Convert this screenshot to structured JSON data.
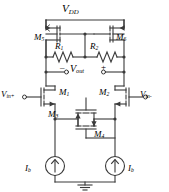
{
  "figure": {
    "kind": "circuit-schematic",
    "stroke_color": "#3a3a3a",
    "text_color": "#000000",
    "background_color": "#ffffff"
  },
  "labels": {
    "supply": {
      "name": "V",
      "subscript": "DD",
      "text": "VDD"
    },
    "m5": {
      "name": "M",
      "subscript": "5",
      "text": "M5"
    },
    "m6": {
      "name": "M",
      "subscript": "6",
      "text": "M6"
    },
    "r1": {
      "name": "R",
      "subscript": "1",
      "text": "R1"
    },
    "r2": {
      "name": "R",
      "subscript": "2",
      "text": "R2"
    },
    "vout": {
      "name": "V",
      "subscript": "out",
      "text": "Vout"
    },
    "vout_minus_sign": "–",
    "vout_plus_sign": "+",
    "vin_plus": {
      "name": "V",
      "subscript": "in+",
      "text": "Vin+"
    },
    "vin_minus": {
      "name": "V",
      "subscript": "in-",
      "text": "Vin-"
    },
    "m1": {
      "name": "M",
      "subscript": "1",
      "text": "M1"
    },
    "m2": {
      "name": "M",
      "subscript": "2",
      "text": "M2"
    },
    "m3": {
      "name": "M",
      "subscript": "3",
      "text": "M3"
    },
    "m4": {
      "name": "M",
      "subscript": "4",
      "text": "M4"
    },
    "ib_left": {
      "name": "I",
      "subscript": "b",
      "text": "Ib"
    },
    "ib_right": {
      "name": "I",
      "subscript": "b",
      "text": "Ib"
    }
  },
  "components": [
    {
      "id": "M5",
      "type": "pmos-transistor",
      "label": "M5"
    },
    {
      "id": "M6",
      "type": "pmos-transistor",
      "label": "M6"
    },
    {
      "id": "R1",
      "type": "resistor",
      "label": "R1"
    },
    {
      "id": "R2",
      "type": "resistor",
      "label": "R2"
    },
    {
      "id": "M1",
      "type": "nmos-transistor",
      "label": "M1"
    },
    {
      "id": "M2",
      "type": "nmos-transistor",
      "label": "M2"
    },
    {
      "id": "M3",
      "type": "nmos-transistor",
      "label": "M3"
    },
    {
      "id": "M4",
      "type": "nmos-transistor",
      "label": "M4"
    },
    {
      "id": "Ib_left",
      "type": "current-source",
      "label": "Ib"
    },
    {
      "id": "Ib_right",
      "type": "current-source",
      "label": "Ib"
    },
    {
      "id": "GND",
      "type": "ground-symbol",
      "label": ""
    }
  ],
  "terminals": [
    {
      "id": "vout-minus",
      "label": "–"
    },
    {
      "id": "vout-plus",
      "label": "+"
    },
    {
      "id": "vin-plus",
      "label": "Vin+"
    },
    {
      "id": "vin-minus",
      "label": "Vin-"
    }
  ]
}
